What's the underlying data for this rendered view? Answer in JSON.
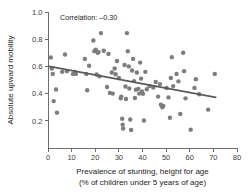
{
  "chart_data": {
    "type": "scatter",
    "title": "",
    "xlabel": "Prevalence of stunting, height for age",
    "xlabel_line2": "(% of children under 5 years of age)",
    "ylabel": "Absolute upward mobility",
    "xlim": [
      0,
      80
    ],
    "ylim": [
      0,
      1.0
    ],
    "grid": false,
    "legend": "none",
    "annotation": "Correlation: –0.30",
    "annotation_value": -0.3,
    "xticks": [
      0,
      10,
      20,
      30,
      40,
      50,
      60,
      70,
      80
    ],
    "xtick_labels": [
      "0",
      "10",
      "20",
      "30",
      "40",
      "50",
      "60",
      "70",
      "80"
    ],
    "yticks": [
      0.2,
      0.4,
      0.6,
      0.8,
      1.0
    ],
    "ytick_labels": [
      "0.2",
      "0.4",
      "0.6",
      "0.8",
      "1.0"
    ],
    "marker_color": "#7d7d7d",
    "trendline_color": "#5a5a5a",
    "axis_color": "#6d6d6d",
    "trendline": {
      "x": [
        0.5,
        71.0
      ],
      "y": [
        0.6,
        0.372
      ]
    },
    "points": [
      {
        "x": 1.2,
        "y": 0.665
      },
      {
        "x": 1.6,
        "y": 0.585
      },
      {
        "x": 2.0,
        "y": 0.545
      },
      {
        "x": 2.4,
        "y": 0.345
      },
      {
        "x": 3.4,
        "y": 0.43
      },
      {
        "x": 3.8,
        "y": 0.26
      },
      {
        "x": 6.0,
        "y": 0.56
      },
      {
        "x": 7.2,
        "y": 0.688
      },
      {
        "x": 8.0,
        "y": 0.565
      },
      {
        "x": 10.6,
        "y": 0.545
      },
      {
        "x": 11.4,
        "y": 0.56
      },
      {
        "x": 11.8,
        "y": 0.545
      },
      {
        "x": 15.6,
        "y": 0.655
      },
      {
        "x": 16.2,
        "y": 0.545
      },
      {
        "x": 16.6,
        "y": 0.425
      },
      {
        "x": 17.4,
        "y": 0.605
      },
      {
        "x": 19.2,
        "y": 0.79
      },
      {
        "x": 19.6,
        "y": 0.712
      },
      {
        "x": 20.2,
        "y": 0.722
      },
      {
        "x": 20.6,
        "y": 0.54
      },
      {
        "x": 21.0,
        "y": 0.7
      },
      {
        "x": 21.4,
        "y": 0.705
      },
      {
        "x": 21.8,
        "y": 0.527
      },
      {
        "x": 22.4,
        "y": 0.845
      },
      {
        "x": 23.6,
        "y": 0.715
      },
      {
        "x": 25.0,
        "y": 0.448
      },
      {
        "x": 25.6,
        "y": 0.692
      },
      {
        "x": 26.2,
        "y": 0.405
      },
      {
        "x": 27.0,
        "y": 0.555
      },
      {
        "x": 27.4,
        "y": 0.4
      },
      {
        "x": 28.2,
        "y": 0.585
      },
      {
        "x": 28.6,
        "y": 0.542
      },
      {
        "x": 29.2,
        "y": 0.64
      },
      {
        "x": 30.0,
        "y": 0.515
      },
      {
        "x": 30.8,
        "y": 0.365
      },
      {
        "x": 31.0,
        "y": 0.378
      },
      {
        "x": 31.4,
        "y": 0.215
      },
      {
        "x": 31.6,
        "y": 0.172
      },
      {
        "x": 31.8,
        "y": 0.143
      },
      {
        "x": 32.4,
        "y": 0.61
      },
      {
        "x": 32.8,
        "y": 0.452
      },
      {
        "x": 33.0,
        "y": 0.36
      },
      {
        "x": 33.4,
        "y": 0.845
      },
      {
        "x": 33.8,
        "y": 0.712
      },
      {
        "x": 34.2,
        "y": 0.6
      },
      {
        "x": 34.4,
        "y": 0.438
      },
      {
        "x": 34.8,
        "y": 0.21
      },
      {
        "x": 35.2,
        "y": 0.132
      },
      {
        "x": 35.6,
        "y": 0.57
      },
      {
        "x": 36.0,
        "y": 0.655
      },
      {
        "x": 36.4,
        "y": 0.492
      },
      {
        "x": 36.8,
        "y": 0.368
      },
      {
        "x": 37.2,
        "y": 0.428
      },
      {
        "x": 37.6,
        "y": 0.555
      },
      {
        "x": 38.2,
        "y": 0.435
      },
      {
        "x": 38.6,
        "y": 0.4
      },
      {
        "x": 39.0,
        "y": 0.628
      },
      {
        "x": 39.4,
        "y": 0.51
      },
      {
        "x": 39.8,
        "y": 0.415
      },
      {
        "x": 40.2,
        "y": 0.398
      },
      {
        "x": 40.6,
        "y": 0.202
      },
      {
        "x": 41.2,
        "y": 0.56
      },
      {
        "x": 41.8,
        "y": 0.432
      },
      {
        "x": 43.0,
        "y": 0.455
      },
      {
        "x": 44.6,
        "y": 0.445
      },
      {
        "x": 45.6,
        "y": 0.485
      },
      {
        "x": 46.6,
        "y": 0.378
      },
      {
        "x": 47.4,
        "y": 0.47
      },
      {
        "x": 47.8,
        "y": 0.318
      },
      {
        "x": 48.4,
        "y": 0.3
      },
      {
        "x": 48.8,
        "y": 0.31
      },
      {
        "x": 50.2,
        "y": 0.442
      },
      {
        "x": 51.0,
        "y": 0.372
      },
      {
        "x": 51.6,
        "y": 0.222
      },
      {
        "x": 52.0,
        "y": 0.515
      },
      {
        "x": 52.4,
        "y": 0.668
      },
      {
        "x": 53.0,
        "y": 0.455
      },
      {
        "x": 54.4,
        "y": 0.545
      },
      {
        "x": 55.2,
        "y": 0.49
      },
      {
        "x": 56.0,
        "y": 0.25
      },
      {
        "x": 57.2,
        "y": 0.7
      },
      {
        "x": 57.6,
        "y": 0.565
      },
      {
        "x": 58.2,
        "y": 0.365
      },
      {
        "x": 60.4,
        "y": 0.135
      },
      {
        "x": 62.0,
        "y": 0.442
      },
      {
        "x": 62.6,
        "y": 0.505
      },
      {
        "x": 64.0,
        "y": 0.395
      },
      {
        "x": 67.8,
        "y": 0.282
      },
      {
        "x": 70.6,
        "y": 0.545
      }
    ]
  }
}
